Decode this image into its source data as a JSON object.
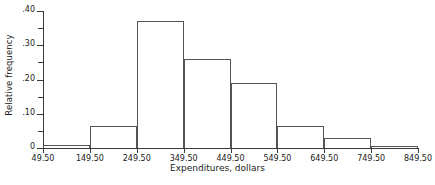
{
  "chart_data": {
    "type": "bar",
    "title": "",
    "xlabel": "Expenditures, dollars",
    "ylabel": "Relative frequency",
    "categories": [
      "49.50-149.50",
      "149.50-249.50",
      "249.50-349.50",
      "349.50-449.50",
      "449.50-549.50",
      "549.50-649.50",
      "649.50-749.50",
      "749.50-849.50"
    ],
    "bin_edges": [
      49.5,
      149.5,
      249.5,
      349.5,
      449.5,
      549.5,
      649.5,
      749.5,
      849.5
    ],
    "values": [
      0.01,
      0.065,
      0.37,
      0.26,
      0.19,
      0.065,
      0.03,
      0.005
    ],
    "ylim": [
      0,
      0.4
    ],
    "xlim": [
      49.5,
      849.5
    ],
    "grid": false,
    "legend": null,
    "bar_style": "outlined-histogram",
    "y_ticks": [
      {
        "value": 0.4,
        "label": ".40",
        "major": true
      },
      {
        "value": 0.35,
        "label": "",
        "major": false
      },
      {
        "value": 0.3,
        "label": ".30",
        "major": true
      },
      {
        "value": 0.25,
        "label": "",
        "major": false
      },
      {
        "value": 0.2,
        "label": ".20",
        "major": true
      },
      {
        "value": 0.15,
        "label": "",
        "major": false
      },
      {
        "value": 0.1,
        "label": ".10",
        "major": true
      },
      {
        "value": 0.05,
        "label": "",
        "major": false
      },
      {
        "value": 0.0,
        "label": "0",
        "major": true
      }
    ],
    "x_ticks": [
      {
        "value": 49.5,
        "label": "49.50"
      },
      {
        "value": 149.5,
        "label": "149.50"
      },
      {
        "value": 249.5,
        "label": "249.50"
      },
      {
        "value": 349.5,
        "label": "349.50"
      },
      {
        "value": 449.5,
        "label": "449.50"
      },
      {
        "value": 549.5,
        "label": "549.50"
      },
      {
        "value": 649.5,
        "label": "649.50"
      },
      {
        "value": 749.5,
        "label": "749.50"
      },
      {
        "value": 849.5,
        "label": "849.50"
      }
    ],
    "colors": {
      "axis": "#3a3a3a",
      "bar_outline": "#555555",
      "text": "#1a1a1a",
      "background": "#ffffff"
    }
  }
}
